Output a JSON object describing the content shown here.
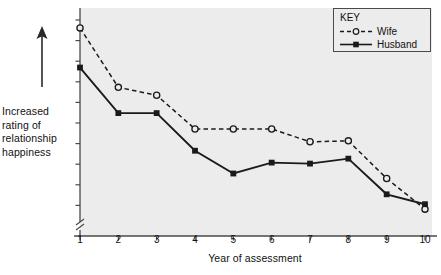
{
  "chart_data": {
    "type": "line",
    "title": "",
    "xlabel": "Year of assessment",
    "ylabel": "Increased rating of relationship happiness",
    "x": [
      1,
      2,
      3,
      4,
      5,
      6,
      7,
      8,
      9,
      10
    ],
    "categories": [
      "1",
      "2",
      "3",
      "4",
      "5",
      "6",
      "7",
      "8",
      "9",
      "10"
    ],
    "series": [
      {
        "name": "Wife",
        "style": "dashed",
        "marker": "open-circle",
        "color": "#1a1a1a",
        "values": [
          10.0,
          7.0,
          6.6,
          4.9,
          4.9,
          4.9,
          4.25,
          4.3,
          2.4,
          0.85
        ]
      },
      {
        "name": "Husband",
        "style": "solid",
        "marker": "filled-square",
        "color": "#1a1a1a",
        "values": [
          8.0,
          5.7,
          5.7,
          3.8,
          2.65,
          3.2,
          3.15,
          3.4,
          1.6,
          1.1
        ]
      }
    ],
    "ylim": [
      0,
      10.4
    ],
    "xlim": [
      1,
      10
    ],
    "grid": false,
    "y_axis_break": true,
    "y_tick_count": 11,
    "y_tick_labels": [],
    "legend_position": "top-right"
  },
  "axis": {
    "y_caption_lines": [
      "Increased",
      "rating of",
      "relationship",
      "happiness"
    ],
    "y_caption_full": "Increased rating of relationship happiness",
    "x_caption": "Year of assessment",
    "x_tick_labels": [
      "1",
      "2",
      "3",
      "4",
      "5",
      "6",
      "7",
      "8",
      "9",
      "10"
    ],
    "up_arrow_icon": "up-arrow-icon",
    "break_icon": "axis-break-icon"
  },
  "legend": {
    "title": "KEY",
    "entries": [
      {
        "label": "Wife",
        "marker": "open-circle",
        "line": "dashed"
      },
      {
        "label": "Husband",
        "marker": "filled-square",
        "line": "solid"
      }
    ]
  },
  "colors": {
    "plot_background": "#ececec",
    "page_background": "#ffffff",
    "ink": "#1a1a1a",
    "axis": "#4a4a4a"
  }
}
